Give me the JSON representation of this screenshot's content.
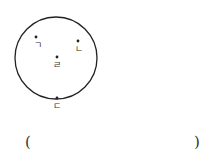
{
  "diagram": {
    "circle": {
      "cx": 56,
      "cy": 58,
      "r": 41,
      "stroke": "#222222"
    },
    "points": [
      {
        "id": "g",
        "label": "ㄱ",
        "x": 36,
        "y": 37,
        "label_x": 38,
        "label_y": 41
      },
      {
        "id": "n",
        "label": "ㄴ",
        "x": 78,
        "y": 41,
        "label_x": 79,
        "label_y": 45
      },
      {
        "id": "r",
        "label": "ㄹ",
        "x": 57,
        "y": 57,
        "label_x": 57,
        "label_y": 62
      },
      {
        "id": "d",
        "label": "ㄷ",
        "x": 57,
        "y": 98,
        "label_x": 57,
        "label_y": 102
      }
    ]
  },
  "answer": {
    "open_paren": "(",
    "close_paren": ")"
  }
}
